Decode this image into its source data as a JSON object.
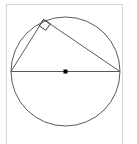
{
  "figure": {
    "background_color": "#ffffff",
    "frame": {
      "name": "diagram-frame",
      "stroke_color": "#d6d6d6",
      "x": 6,
      "y": 4,
      "width": 117,
      "height": 140
    },
    "stroke_color": "#5a5a5a",
    "stroke_width": 1,
    "circle": {
      "label": "circle",
      "center_x": 65.5,
      "center_y": 71.5,
      "radius": 54.5
    },
    "center_point": {
      "label": "center-point",
      "x": 65.5,
      "y": 71.5,
      "size": 4,
      "color": "#000000"
    },
    "diameter": {
      "label": "diameter",
      "x1": 11,
      "y1": 71.5,
      "x2": 120,
      "y2": 71.5
    },
    "triangle": {
      "label": "inscribed-right-triangle",
      "vertices": [
        {
          "name": "left-vertex",
          "x": 11,
          "y": 71.5
        },
        {
          "name": "apex-vertex",
          "x": 43.5,
          "y": 19.5
        },
        {
          "name": "right-vertex",
          "x": 120,
          "y": 71.5
        }
      ],
      "legs": [
        {
          "name": "left-leg",
          "x1": 11,
          "y1": 71.5,
          "x2": 43.5,
          "y2": 19.5
        },
        {
          "name": "right-leg",
          "x1": 43.5,
          "y1": 19.5,
          "x2": 120,
          "y2": 71.5
        }
      ]
    },
    "right_angle_marker": {
      "label": "right-angle-marker",
      "at_vertex": "apex-vertex",
      "points": "43.5,19.5 50.3,23.8 45.8,30.3 39.3,25.8",
      "size": 8
    }
  }
}
